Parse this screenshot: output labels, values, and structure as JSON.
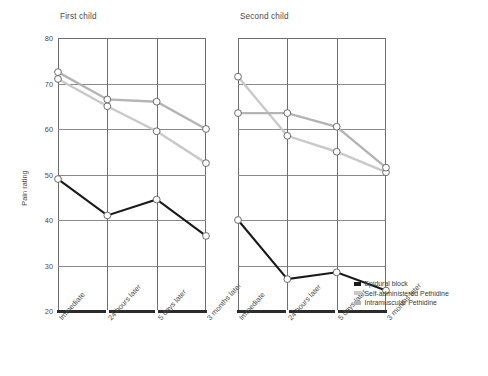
{
  "chart_data": {
    "type": "line",
    "title": "",
    "panels": [
      {
        "title": "First child",
        "categories": [
          "Immediate",
          "24 hours later",
          "5 days later",
          "3 months later"
        ],
        "series": [
          {
            "name": "Epidural block",
            "values": [
              49,
              41,
              44.5,
              36.5
            ],
            "color": "#1a1a1a"
          },
          {
            "name": "Self-administered Pethidine",
            "values": [
              71,
              65,
              59.5,
              52.5
            ],
            "color": "#c9c9c9"
          },
          {
            "name": "Intramuscular Pethidine",
            "values": [
              72.5,
              66.5,
              66,
              60
            ],
            "color": "#b4b4b4"
          }
        ]
      },
      {
        "title": "Second child",
        "categories": [
          "Immediate",
          "24 hours later",
          "5 days later",
          "3 months later"
        ],
        "series": [
          {
            "name": "Epidural block",
            "values": [
              40,
              27,
              28.5,
              24.5
            ],
            "color": "#1a1a1a"
          },
          {
            "name": "Self-administered Pethidine",
            "values": [
              71.5,
              58.5,
              55,
              50.5
            ],
            "color": "#c9c9c9"
          },
          {
            "name": "Intramuscular Pethidine",
            "values": [
              63.5,
              63.5,
              60.5,
              51.5
            ],
            "color": "#b4b4b4"
          }
        ]
      }
    ],
    "ylabel": "Pain rating",
    "xlabel": "",
    "yticks": [
      20,
      30,
      40,
      50,
      60,
      70,
      80
    ],
    "ylim": [
      20,
      80
    ],
    "grid": true,
    "legend_position": "bottom-right",
    "legend": [
      {
        "label": "Epidural block",
        "color": "#1a1a1a"
      },
      {
        "label": "Self-administered Pethidine",
        "color": "#c9c9c9"
      },
      {
        "label": "Intramuscular Pethidine",
        "color": "#b4b4b4"
      }
    ]
  }
}
